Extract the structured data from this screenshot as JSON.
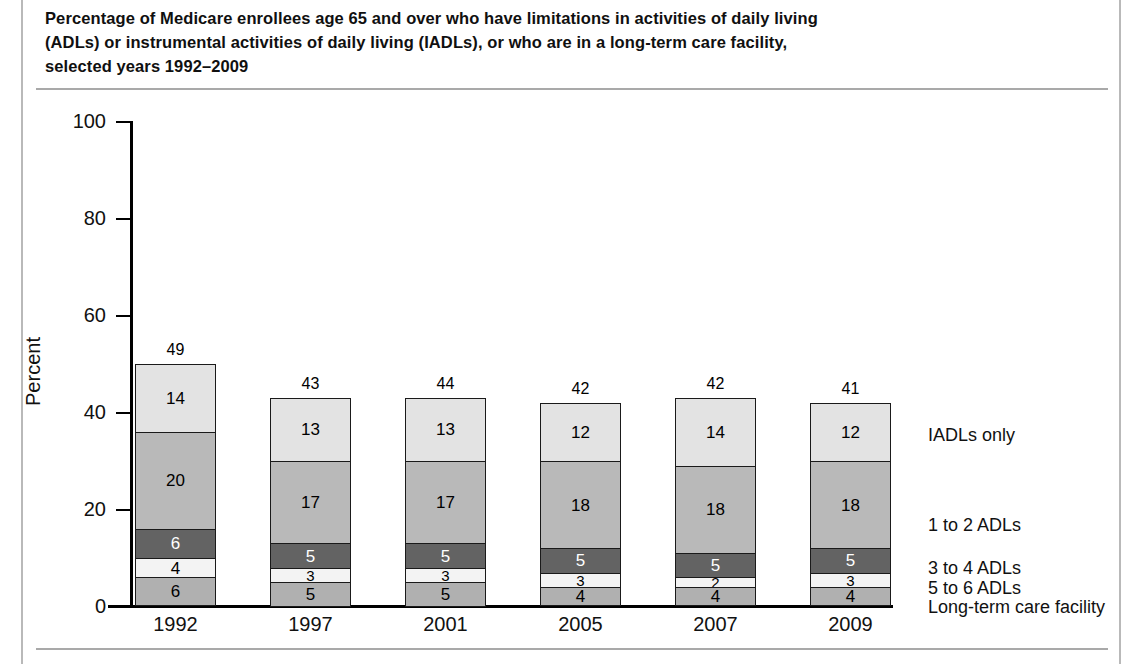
{
  "title": {
    "line1": "Percentage of Medicare enrollees age 65 and over who have limitations in activities of daily living",
    "line2": "(ADLs) or instrumental activities of daily living (IADLs), or who are in a long-term care facility,",
    "line3": "selected years 1992–2009"
  },
  "chart_data": {
    "type": "bar",
    "subtype": "stacked-bar",
    "xlabel": "",
    "ylabel": "Percent",
    "ylim": [
      0,
      100
    ],
    "yticks": [
      0,
      20,
      40,
      60,
      80,
      100
    ],
    "ytick_labels": [
      "0",
      "20",
      "40",
      "60",
      "80",
      "100"
    ],
    "grid": false,
    "legend_position": "right-inline",
    "categories": [
      "1992",
      "1997",
      "2001",
      "2005",
      "2007",
      "2009"
    ],
    "totals": [
      49,
      43,
      44,
      42,
      42,
      41
    ],
    "stack_order_bottom_to_top": [
      "Long-term care facility",
      "5 to 6 ADLs",
      "3 to 4 ADLs",
      "1 to 2 ADLs",
      "IADLs only"
    ],
    "series": [
      {
        "name": "Long-term care facility",
        "color": "#b0b0b0",
        "label_color": "#000000",
        "values": [
          6,
          5,
          5,
          4,
          4,
          4
        ]
      },
      {
        "name": "5 to 6 ADLs",
        "color": "#f3f3f3",
        "label_color": "#000000",
        "values": [
          4,
          3,
          3,
          3,
          2,
          3
        ]
      },
      {
        "name": "3 to 4 ADLs",
        "color": "#636363",
        "label_color": "#ffffff",
        "values": [
          6,
          5,
          5,
          5,
          5,
          5
        ]
      },
      {
        "name": "1 to 2 ADLs",
        "color": "#b9b9b9",
        "label_color": "#000000",
        "values": [
          20,
          17,
          17,
          18,
          18,
          18
        ]
      },
      {
        "name": "IADLs only",
        "color": "#e3e3e3",
        "label_color": "#000000",
        "values": [
          14,
          13,
          13,
          12,
          14,
          12
        ]
      }
    ]
  },
  "axis": {
    "y_title": "Percent",
    "y_tick_100": "100",
    "y_tick_80": "80",
    "y_tick_60": "60",
    "y_tick_40": "40",
    "y_tick_20": "20",
    "y_tick_0": "0"
  },
  "x_categories": {
    "c0": "1992",
    "c1": "1997",
    "c2": "2001",
    "c3": "2005",
    "c4": "2007",
    "c5": "2009"
  },
  "totals_labels": {
    "t0": "49",
    "t1": "43",
    "t2": "44",
    "t3": "42",
    "t4": "42",
    "t5": "41"
  },
  "legend": {
    "iadls_only": "IADLs only",
    "adls_1_2": "1 to 2 ADLs",
    "adls_3_4": "3 to 4 ADLs",
    "adls_5_6": "5 to 6 ADLs",
    "ltc": "Long-term care facility"
  },
  "bar_labels": {
    "b0": {
      "s0": "6",
      "s1": "4",
      "s2": "6",
      "s3": "20",
      "s4": "14"
    },
    "b1": {
      "s0": "5",
      "s1": "3",
      "s2": "5",
      "s3": "17",
      "s4": "13"
    },
    "b2": {
      "s0": "5",
      "s1": "3",
      "s2": "5",
      "s3": "17",
      "s4": "13"
    },
    "b3": {
      "s0": "4",
      "s1": "3",
      "s2": "5",
      "s3": "18",
      "s4": "12"
    },
    "b4": {
      "s0": "4",
      "s1": "2",
      "s2": "5",
      "s3": "18",
      "s4": "14"
    },
    "b5": {
      "s0": "4",
      "s1": "3",
      "s2": "5",
      "s3": "18",
      "s4": "12"
    }
  }
}
